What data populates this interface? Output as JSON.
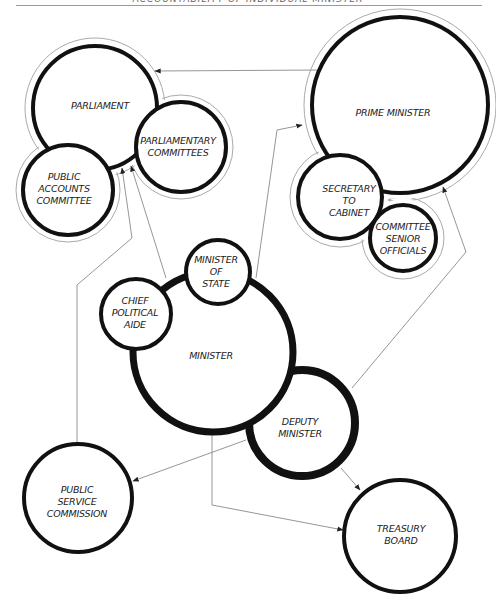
{
  "header": {
    "title": "ACCOUNTABILITY OF INDIVIDUAL MINISTER"
  },
  "colors": {
    "stroke": "#111111",
    "connector": "#8a8a8a",
    "halo": "#aaaaaa",
    "background": "#ffffff"
  },
  "nodes": {
    "parliament": {
      "label": "PARLIAMENT"
    },
    "public_accounts_committee": {
      "label": "PUBLIC\nACCOUNTS\nCOMMITTEE"
    },
    "parliamentary_committees": {
      "label": "PARLIAMENTARY\nCOMMITTEES"
    },
    "prime_minister": {
      "label": "PRIME MINISTER"
    },
    "secretary_to_cabinet": {
      "label": "SECRETARY\nTO\nCABINET"
    },
    "committee_senior_officials": {
      "label": "COMMITTEE\nSENIOR\nOFFICIALS"
    },
    "minister_of_state": {
      "label": "MINISTER\nOF\nSTATE"
    },
    "chief_political_aide": {
      "label": "CHIEF\nPOLITICAL\nAIDE"
    },
    "minister": {
      "label": "MINISTER"
    },
    "deputy_minister": {
      "label": "DEPUTY\nMINISTER"
    },
    "public_service_commission": {
      "label": "PUBLIC\nSERVICE\nCOMMISSION"
    },
    "treasury_board": {
      "label": "TREASURY\nBOARD"
    }
  },
  "edges": [
    {
      "from": "Prime Minister",
      "to": "Parliament"
    },
    {
      "from": "Minister of State",
      "to": "Prime Minister"
    },
    {
      "from": "Deputy Minister",
      "to": "Prime Minister"
    },
    {
      "from": "Public Service Commission",
      "to": "Parliament"
    },
    {
      "from": "Minister",
      "to": "Parliament"
    },
    {
      "from": "Deputy Minister",
      "to": "Public Service Commission"
    },
    {
      "from": "Minister",
      "to": "Treasury Board"
    },
    {
      "from": "Deputy Minister",
      "to": "Treasury Board"
    }
  ]
}
